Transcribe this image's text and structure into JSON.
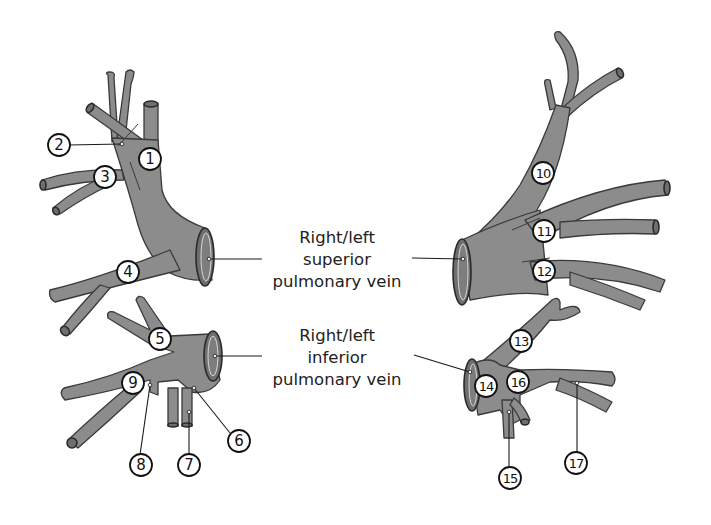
{
  "diagram": {
    "vessel_color": "#8c8c8c",
    "outline_color": "#3a3a3a",
    "superior_label": {
      "line1": "Right/left",
      "line2": "superior",
      "line3": "pulmonary vein"
    },
    "inferior_label": {
      "line1": "Right/left",
      "line2": "inferior",
      "line3": "pulmonary vein"
    },
    "markers": [
      {
        "n": "1",
        "x": 150,
        "y": 159
      },
      {
        "n": "2",
        "x": 59,
        "y": 145
      },
      {
        "n": "3",
        "x": 105,
        "y": 177
      },
      {
        "n": "4",
        "x": 128,
        "y": 272
      },
      {
        "n": "5",
        "x": 160,
        "y": 339
      },
      {
        "n": "6",
        "x": 239,
        "y": 441
      },
      {
        "n": "7",
        "x": 189,
        "y": 465
      },
      {
        "n": "8",
        "x": 141,
        "y": 465
      },
      {
        "n": "9",
        "x": 133,
        "y": 383
      },
      {
        "n": "10",
        "x": 543,
        "y": 173
      },
      {
        "n": "11",
        "x": 544,
        "y": 231
      },
      {
        "n": "12",
        "x": 544,
        "y": 271
      },
      {
        "n": "13",
        "x": 521,
        "y": 341
      },
      {
        "n": "14",
        "x": 486,
        "y": 386
      },
      {
        "n": "15",
        "x": 510,
        "y": 478
      },
      {
        "n": "16",
        "x": 518,
        "y": 382
      },
      {
        "n": "17",
        "x": 576,
        "y": 463
      }
    ]
  }
}
